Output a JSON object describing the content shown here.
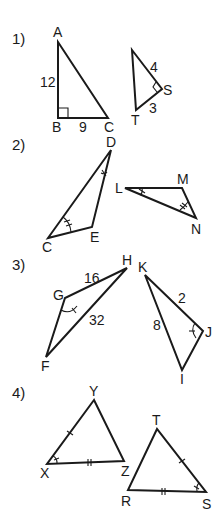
{
  "worksheet": {
    "problems": [
      {
        "number": "1)",
        "triangles": [
          {
            "vertices": {
              "A": "A",
              "B": "B",
              "C": "C"
            },
            "side_labels": {
              "AB": "12",
              "BC": "9"
            },
            "right_angle_at": "B"
          },
          {
            "vertices": {
              "R": "R",
              "S": "S",
              "T": "T"
            },
            "side_labels": {
              "RS": "4",
              "ST": "3"
            },
            "right_angle_at": "S"
          }
        ]
      },
      {
        "number": "2)",
        "triangles": [
          {
            "vertices": {
              "D": "D",
              "C": "C",
              "E": "E"
            },
            "angle_marks": {
              "D": "single tick arc",
              "C": "double tick arc"
            }
          },
          {
            "vertices": {
              "L": "L",
              "M": "M",
              "N": "N"
            },
            "angle_marks": {
              "L": "single tick arc",
              "N": "double tick arc"
            }
          }
        ]
      },
      {
        "number": "3)",
        "triangles": [
          {
            "vertices": {
              "H": "H",
              "G": "G",
              "F": "F"
            },
            "side_labels": {
              "GH": "16",
              "FH": "32"
            },
            "angle_marks": {
              "G": "single tick arc"
            }
          },
          {
            "vertices": {
              "K": "K",
              "J": "J",
              "I": "I"
            },
            "side_labels": {
              "KJ": "2",
              "KI": "8"
            },
            "angle_marks": {
              "J": "single tick arc"
            }
          }
        ]
      },
      {
        "number": "4)",
        "triangles": [
          {
            "vertices": {
              "Y": "Y",
              "X": "X",
              "Z": "Z"
            },
            "side_marks": {
              "XY": "single tick",
              "XZ": "double tick"
            },
            "angle_marks": {
              "X": "single tick arc"
            }
          },
          {
            "vertices": {
              "T": "T",
              "R": "R",
              "S": "S"
            },
            "side_marks": {
              "TS": "single tick",
              "RS": "double tick"
            },
            "angle_marks": {
              "S": "single tick arc"
            }
          }
        ]
      }
    ]
  }
}
